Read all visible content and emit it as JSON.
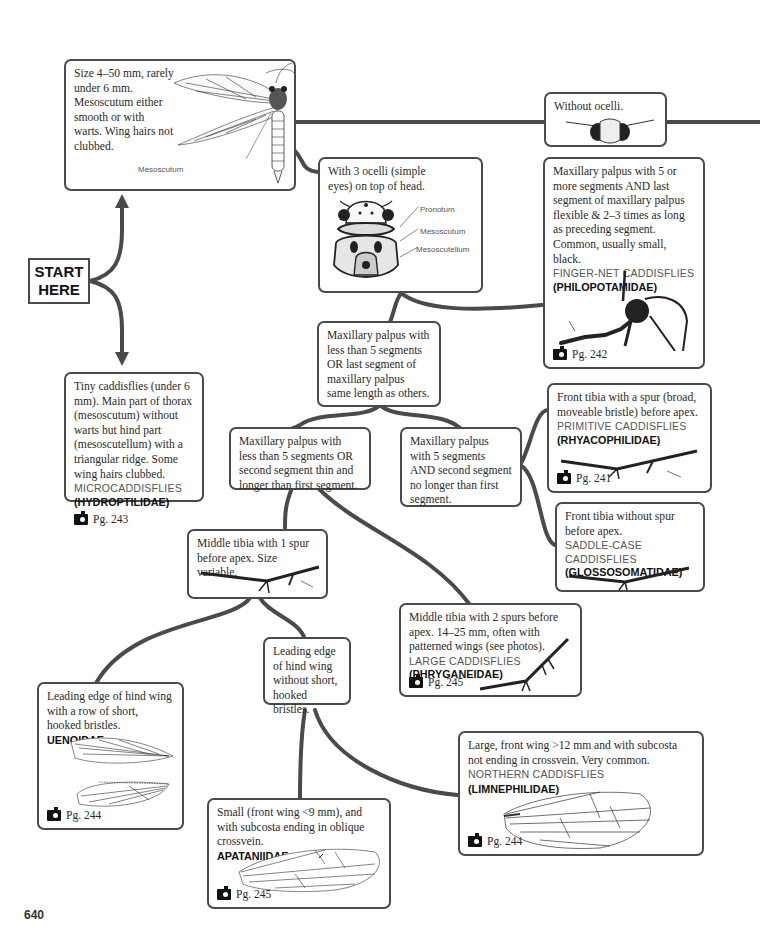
{
  "start": {
    "line1": "START",
    "line2": "HERE"
  },
  "page_number": "640",
  "colors": {
    "connector": "#4a4a4a",
    "box_border": "#4a4a4a",
    "common_name": "#555555",
    "family_name": "#111111"
  },
  "nodes": {
    "large": {
      "text": "Size 4–50 mm, rarely under 6 mm. Mesoscutum either smooth or with warts. Wing hairs not clubbed.",
      "label": "Mesoscutum",
      "illustration": "adult-caddisfly-dorsal"
    },
    "without_ocelli": {
      "text": "Without ocelli.",
      "illustration": "head-without-ocelli"
    },
    "with_ocelli": {
      "text": "With 3 ocelli (simple eyes) on top of head.",
      "labels": [
        "Pronotum",
        "Mesoscutum",
        "Mesoscutellum"
      ],
      "illustration": "thorax-with-ocelli"
    },
    "philopotamidae": {
      "text": "Maxillary palpus with 5 or more segments AND last segment of maxillary palpus flexible &  2–3 times as long as preceding segment.  Common, usually small, black.",
      "common": "FINGER-NET CADDISFLIES",
      "family": "(PHILOPOTAMIDAE)",
      "page": "Pg. 242",
      "illustration": "maxillary-palpus-head"
    },
    "palpus_less5": {
      "text": "Maxillary palpus with less than 5 segments OR last segment of maxillary palpus same length as others."
    },
    "hydroptilidae": {
      "text": "Tiny caddisflies (under 6 mm). Main part of thorax (mesoscutum) without warts but hind part (mesoscutellum) with a triangular ridge. Some wing hairs clubbed.",
      "common": "MICROCADDISFLIES",
      "family": "(HYDROPTILIDAE)",
      "page": "Pg. 243"
    },
    "second_segment_long": {
      "text": "Maxillary palpus with less than 5 segments OR second segment thin and longer than first segment."
    },
    "second_segment_short": {
      "text": "Maxillary palpus with 5 segments AND second segment no longer than first segment."
    },
    "rhyacophilidae": {
      "text": "Front tibia with a spur (broad, moveable bristle) before apex.",
      "common": "PRIMITIVE CADDISFLIES",
      "family": "(RHYACOPHILIDAE)",
      "page": "Pg. 241",
      "illustration": "front-tibia-with-spur"
    },
    "glossosomatidae": {
      "text": "Front tibia without spur before apex.",
      "common": "SADDLE-CASE CADDISFLIES",
      "family": "(GLOSSOSOMATIDAE)",
      "illustration": "front-tibia-without-spur"
    },
    "middle_1spur": {
      "text": "Middle tibia with 1 spur before apex. Size variable.",
      "illustration": "middle-tibia-one-spur"
    },
    "phryganeidae": {
      "text": "Middle tibia with 2 spurs before apex. 14–25 mm, often with patterned wings (see photos).",
      "common": "LARGE CADDISFLIES",
      "family": "(PHRYGANEIDAE)",
      "page": "Pg. 245",
      "illustration": "middle-tibia-two-spurs"
    },
    "without_bristles": {
      "text": "Leading edge of hind wing without short, hooked bristles."
    },
    "uenoidae": {
      "text": "Leading edge of hind wing with a row of short, hooked bristles.",
      "family": "UENOIDAE",
      "page": "Pg. 244",
      "illustration": "front-and-hind-wing"
    },
    "apataniidae": {
      "text": "Small (front wing <9 mm), and with subcosta ending in oblique crossvein.",
      "family": "APATANIIDAE",
      "page": "Pg. 245",
      "illustration": "wing-oblique-crossvein"
    },
    "limnephilidae": {
      "text": "Large, front wing >12 mm and with subcosta not ending in crossvein. Very common.",
      "common": "NORTHERN CADDISFLIES",
      "family": "(LIMNEPHILIDAE)",
      "page": "Pg. 244",
      "illustration": "front-wing"
    }
  }
}
